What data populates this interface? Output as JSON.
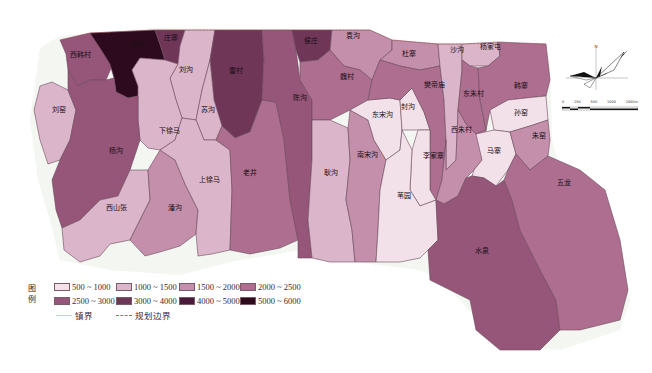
{
  "map": {
    "legend_title": "图例",
    "legend_classes": [
      {
        "range": "500 ~ 1000",
        "color": "#f3e1ea"
      },
      {
        "range": "1000 ~ 1500",
        "color": "#dbb5c9"
      },
      {
        "range": "1500 ~ 2000",
        "color": "#c48fab"
      },
      {
        "range": "2000 ~ 2500",
        "color": "#ad6e90"
      },
      {
        "range": "2500 ~ 3000",
        "color": "#965679"
      },
      {
        "range": "3000 ~ 4000",
        "color": "#6f3658"
      },
      {
        "range": "4000 ~ 5000",
        "color": "#4a1b38"
      },
      {
        "range": "5000 ~ 6000",
        "color": "#2e0a1f"
      }
    ],
    "legend_lines": [
      {
        "label": "镇界",
        "style": "solid",
        "color": "#e6c79a"
      },
      {
        "label": "规划边界",
        "style": "dashed",
        "color": "#d9534f"
      }
    ],
    "regions": [
      {
        "name": "西韩村",
        "class": 4
      },
      {
        "name": "韩村",
        "class": 7
      },
      {
        "name": "庄寨",
        "class": 5
      },
      {
        "name": "刘沟",
        "class": 1
      },
      {
        "name": "雷村",
        "class": 5
      },
      {
        "name": "苏沟",
        "class": 1
      },
      {
        "name": "下徐马",
        "class": 1
      },
      {
        "name": "刘窑",
        "class": 1
      },
      {
        "name": "杨沟",
        "class": 4
      },
      {
        "name": "西山张",
        "class": 1
      },
      {
        "name": "潘沟",
        "class": 2
      },
      {
        "name": "上徐马",
        "class": 1
      },
      {
        "name": "老井",
        "class": 3
      },
      {
        "name": "陈沟",
        "class": 4
      },
      {
        "name": "侯庄",
        "class": 5
      },
      {
        "name": "袁沟",
        "class": 2
      },
      {
        "name": "魏村",
        "class": 3
      },
      {
        "name": "耿沟",
        "class": 1
      },
      {
        "name": "南宋沟",
        "class": 2
      },
      {
        "name": "东宋沟",
        "class": 0
      },
      {
        "name": "封沟",
        "class": 0
      },
      {
        "name": "杜寨",
        "class": 2
      },
      {
        "name": "樊帝庙",
        "class": 3
      },
      {
        "name": "沙沟",
        "class": 1
      },
      {
        "name": "杨家屯",
        "class": 1
      },
      {
        "name": "东朱村",
        "class": 3
      },
      {
        "name": "韩寨",
        "class": 3
      },
      {
        "name": "孙窑",
        "class": 0
      },
      {
        "name": "西朱村",
        "class": 2
      },
      {
        "name": "李家寨",
        "class": 0
      },
      {
        "name": "马寨",
        "class": 0
      },
      {
        "name": "朱窑",
        "class": 2
      },
      {
        "name": "苇园",
        "class": 0
      },
      {
        "name": "水泉",
        "class": 4
      },
      {
        "name": "五龙",
        "class": 2
      }
    ]
  },
  "labels": {
    "xihancun": "西韩村",
    "hancun": "韩村",
    "zhuangzhai": "庄寨",
    "liugou": "刘沟",
    "leicun": "雷村",
    "sugou": "苏沟",
    "xiaxuma": "下徐马",
    "liuyao": "刘窑",
    "yanggou": "杨沟",
    "xishanzhang": "西山张",
    "pangou": "潘沟",
    "shangxuma": "上徐马",
    "laojing": "老井",
    "chengou": "陈沟",
    "houzhuang": "侯庄",
    "yuangou": "袁沟",
    "weicun": "魏村",
    "genggou": "耿沟",
    "nansonggou": "南宋沟",
    "dongsonggou": "东宋沟",
    "fenggou": "封沟",
    "duzhai": "杜寨",
    "fandimiao": "樊帝庙",
    "shagou": "沙沟",
    "yangjiatun": "杨家屯",
    "dongzhucun": "东朱村",
    "hanzhai": "韩寨",
    "sunyao": "孙窑",
    "xizhucun": "西朱村",
    "lijiazhai": "李家寨",
    "mazhai": "马寨",
    "zhuyao": "朱窑",
    "weiyuan": "苇园",
    "shuiquan": "水泉",
    "wulong": "五龙"
  },
  "legend": {
    "title": "图例",
    "c0": "500 ~ 1000",
    "c1": "1000 ~ 1500",
    "c2": "1500 ~ 2000",
    "c3": "2000 ~ 2500",
    "c4": "2500 ~ 3000",
    "c5": "3000 ~ 4000",
    "c6": "4000 ~ 5000",
    "c7": "5000 ~ 6000",
    "town_boundary": "镇界",
    "plan_boundary": "规划边界"
  },
  "compass": {
    "north": "N"
  },
  "scale_bar": {
    "ticks": [
      "0",
      "250",
      "500",
      "1000",
      "2000m"
    ]
  }
}
